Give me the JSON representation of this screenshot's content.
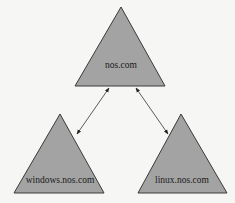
{
  "diagram": {
    "nodes": [
      {
        "id": "root",
        "label": "nos.com",
        "shape": "triangle"
      },
      {
        "id": "windows",
        "label": "windows.nos.com",
        "shape": "triangle"
      },
      {
        "id": "linux",
        "label": "linux.nos.com",
        "shape": "triangle"
      }
    ],
    "edges": [
      {
        "from": "root",
        "to": "windows",
        "type": "bidirectional-arrow"
      },
      {
        "from": "root",
        "to": "linux",
        "type": "bidirectional-arrow"
      }
    ],
    "colors": {
      "fill": "#a3a3a3",
      "stroke": "#3a3a3a",
      "background": "#f6f6f4"
    }
  }
}
